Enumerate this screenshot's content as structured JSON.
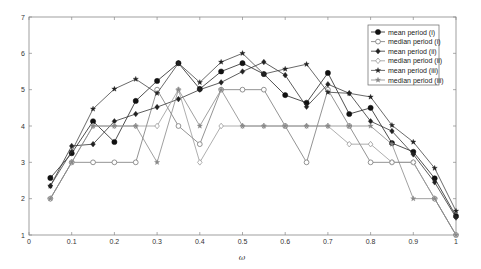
{
  "chart_data": {
    "type": "line",
    "title": "",
    "xlabel": "ω",
    "ylabel": "",
    "xlim": [
      0,
      1
    ],
    "ylim": [
      1,
      7
    ],
    "grid": false,
    "legend_position": "upper right",
    "x_ticks": [
      "0",
      "0.1",
      "0.2",
      "0.3",
      "0.4",
      "0.5",
      "0.6",
      "0.7",
      "0.8",
      "0.9",
      "1"
    ],
    "y_ticks": [
      "1",
      "2",
      "3",
      "4",
      "5",
      "6",
      "7"
    ],
    "x": [
      0.05,
      0.1,
      0.15,
      0.2,
      0.25,
      0.3,
      0.35,
      0.4,
      0.45,
      0.5,
      0.55,
      0.6,
      0.65,
      0.7,
      0.75,
      0.8,
      0.85,
      0.9,
      0.95,
      1.0
    ],
    "series": [
      {
        "name": "mean period (i)",
        "marker": "filled-circle",
        "color": "#222222",
        "values": [
          2.57,
          3.25,
          4.13,
          3.56,
          4.69,
          5.24,
          5.73,
          5.02,
          5.5,
          5.73,
          5.43,
          4.85,
          4.64,
          5.46,
          4.33,
          4.5,
          3.53,
          3.29,
          2.56,
          1.52
        ]
      },
      {
        "name": "median period (i)",
        "marker": "open-circle",
        "color": "#777777",
        "values": [
          2,
          3,
          3,
          3,
          3,
          5,
          4,
          3.5,
          5,
          5,
          5,
          4,
          3,
          5,
          4,
          3,
          3,
          3,
          2,
          1
        ]
      },
      {
        "name": "mean period (ii)",
        "marker": "filled-diamond",
        "color": "#333333",
        "values": [
          2.35,
          3.45,
          3.5,
          4.13,
          4.33,
          4.52,
          4.74,
          5.0,
          5.2,
          5.5,
          5.76,
          5.4,
          4.53,
          5.15,
          4.9,
          4.13,
          3.86,
          3.22,
          2.45,
          1.48
        ]
      },
      {
        "name": "median period (ii)",
        "marker": "open-diamond",
        "color": "#999999",
        "values": [
          2,
          3,
          4,
          4,
          4,
          4,
          5,
          3,
          4,
          4,
          4,
          4,
          4,
          4,
          3.5,
          3.5,
          3,
          3,
          2,
          1
        ]
      },
      {
        "name": "mean period (iii)",
        "marker": "star",
        "color": "#444444",
        "values": [
          2.35,
          3.3,
          4.47,
          5.02,
          5.29,
          4.9,
          5.73,
          5.2,
          5.76,
          6.0,
          5.43,
          5.57,
          5.7,
          4.93,
          4.9,
          4.8,
          4.02,
          3.56,
          2.84,
          1.66
        ]
      },
      {
        "name": "median period (iii)",
        "marker": "gray-star",
        "color": "#888888",
        "values": [
          2,
          3,
          4,
          4,
          4,
          3,
          5,
          4,
          5,
          4,
          4,
          4,
          4,
          4,
          4,
          4,
          3.5,
          2,
          2,
          1
        ]
      }
    ]
  },
  "legend": {
    "items": [
      {
        "label": "mean period (i)"
      },
      {
        "label": "median period (i)"
      },
      {
        "label": "mean period (ii)"
      },
      {
        "label": "median period (ii)"
      },
      {
        "label": "mean period (iii)"
      },
      {
        "label": "median period (iii)"
      }
    ]
  }
}
